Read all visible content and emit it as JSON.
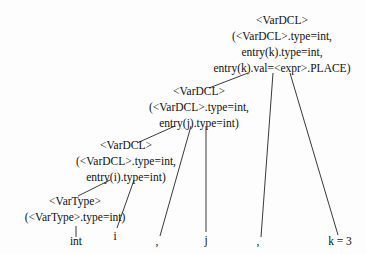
{
  "nodes": {
    "root": {
      "label": "<VarDCL>",
      "attrs": [
        "(<VarDCL>.type=int,",
        "entry(k).type=int,",
        "entry(k).val=<expr>.PLACE)"
      ]
    },
    "mid": {
      "label": "<VarDCL>",
      "attrs": [
        "(<VarDCL>.type=int,",
        "entry(j).type=int)"
      ]
    },
    "low": {
      "label": "<VarDCL>",
      "attrs": [
        "(<VarDCL>.type=int,",
        "entry(i).type=int)"
      ]
    },
    "vartype": {
      "label": "<VarType>",
      "attrs": [
        "(<VarType>.type=int)"
      ]
    }
  },
  "leaves": [
    "int",
    "i",
    ",",
    "j",
    ",",
    "k = 3"
  ]
}
